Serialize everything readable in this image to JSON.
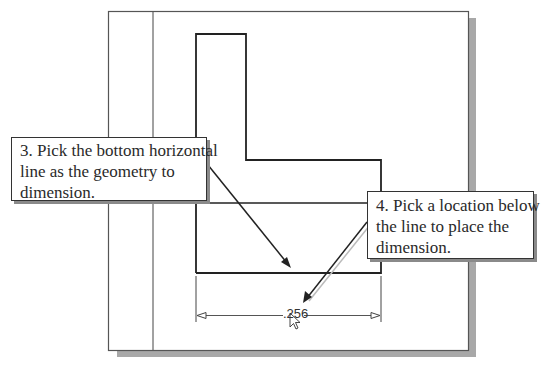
{
  "callouts": {
    "step3": {
      "lines": [
        "3. Pick the bottom horizontal",
        "line as the geometry to",
        "dimension."
      ]
    },
    "step4": {
      "lines": [
        "4. Pick a location below",
        "the line to place the",
        "dimension."
      ]
    }
  },
  "dimension": {
    "value": ".256"
  },
  "colors": {
    "line": "#222222",
    "frame": "#555555",
    "shadow": "#a8a8a8"
  }
}
